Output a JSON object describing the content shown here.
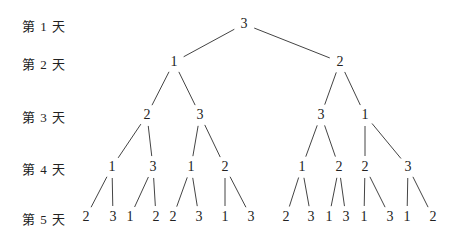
{
  "diagram": {
    "type": "tree",
    "day_labels": [
      "第 1 天",
      "第 2 天",
      "第 3 天",
      "第 4 天",
      "第 5 天"
    ],
    "levels": [
      {
        "y": 24,
        "nodes": [
          {
            "label": "3",
            "x": 244
          }
        ]
      },
      {
        "y": 62,
        "nodes": [
          {
            "label": "1",
            "x": 174
          },
          {
            "label": "2",
            "x": 340
          }
        ]
      },
      {
        "y": 115,
        "nodes": [
          {
            "label": "2",
            "x": 147
          },
          {
            "label": "3",
            "x": 200
          },
          {
            "label": "3",
            "x": 321
          },
          {
            "label": "1",
            "x": 365
          }
        ]
      },
      {
        "y": 167,
        "nodes": [
          {
            "label": "1",
            "x": 112
          },
          {
            "label": "3",
            "x": 153
          },
          {
            "label": "1",
            "x": 191
          },
          {
            "label": "2",
            "x": 225
          },
          {
            "label": "1",
            "x": 302
          },
          {
            "label": "2",
            "x": 339
          },
          {
            "label": "2",
            "x": 365
          },
          {
            "label": "3",
            "x": 408
          }
        ]
      },
      {
        "y": 217,
        "nodes": [
          {
            "label": "2",
            "x": 86
          },
          {
            "label": "3",
            "x": 113
          },
          {
            "label": "1",
            "x": 130
          },
          {
            "label": "2",
            "x": 156
          },
          {
            "label": "2",
            "x": 173
          },
          {
            "label": "3",
            "x": 199
          },
          {
            "label": "1",
            "x": 225
          },
          {
            "label": "3",
            "x": 251
          },
          {
            "label": "2",
            "x": 286
          },
          {
            "label": "3",
            "x": 311
          },
          {
            "label": "1",
            "x": 329
          },
          {
            "label": "3",
            "x": 346
          },
          {
            "label": "1",
            "x": 364
          },
          {
            "label": "3",
            "x": 390
          },
          {
            "label": "1",
            "x": 407
          },
          {
            "label": "2",
            "x": 433
          }
        ]
      }
    ],
    "edges_note": "each node at level k has 2 children at level k+1, in order"
  }
}
